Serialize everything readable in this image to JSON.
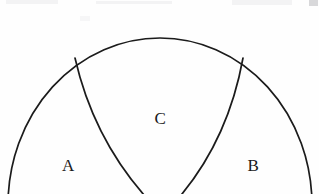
{
  "page": {
    "background_color": "#fefefe",
    "width": 319,
    "height": 194,
    "media": "scanned-paper"
  },
  "figure": {
    "name": "partitioned-ellipse-diagram",
    "stroke_color": "#1b1b1b",
    "fill_color": "none",
    "stroke_width": 1.7,
    "outer_shape": {
      "name": "outer-ellipse",
      "type": "ellipse",
      "center_x": 160,
      "center_y": 205,
      "radius_x": 152,
      "radius_y": 167,
      "apex_point": [
        160,
        38
      ],
      "left_extent_x": 8,
      "right_extent_x": 311,
      "cropped_at_bottom": true
    },
    "divider_arcs": [
      {
        "name": "left-divider-arc",
        "start_point": [
          75,
          58
        ],
        "end_point": [
          163,
          215
        ],
        "control_point": [
          96,
          150
        ],
        "curves_toward": "right"
      },
      {
        "name": "right-divider-arc",
        "start_point": [
          243,
          58
        ],
        "end_point": [
          163,
          215
        ],
        "control_point": [
          226,
          152
        ],
        "curves_toward": "left"
      }
    ],
    "regions": [
      {
        "key": "a",
        "label": "A",
        "position": "lower-left",
        "x": 68,
        "y": 165
      },
      {
        "key": "c",
        "label": "C",
        "position": "upper-center",
        "x": 160,
        "y": 118
      },
      {
        "key": "b",
        "label": "B",
        "position": "lower-right",
        "x": 253,
        "y": 165
      }
    ]
  },
  "artifacts": {
    "top_left": "scan-smudge",
    "top_mid": "scan-smudge",
    "top_right": "scan-smudge",
    "corner_mark": "corner-mark",
    "speck": "scan-speck"
  }
}
